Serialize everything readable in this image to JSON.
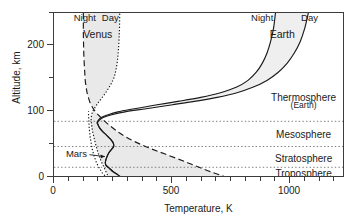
{
  "chart_data": {
    "type": "line",
    "title": "",
    "xlabel": "Temperature, K",
    "ylabel": "Altitude, km",
    "xlim": [
      0,
      1230
    ],
    "ylim": [
      0,
      262
    ],
    "xticks_major": [
      0,
      500,
      1000
    ],
    "xticks_major_labels": [
      "0",
      "500",
      "1000"
    ],
    "xticks_minor": [
      62.5,
      125,
      187.5,
      250,
      312.5,
      375,
      437.5,
      562.5,
      625,
      687.5,
      750,
      812.5,
      875,
      937.5,
      1062.5,
      1125,
      1187.5
    ],
    "yticks_major": [
      0,
      100,
      200
    ],
    "yticks_major_labels": [
      "0",
      "100",
      "200"
    ],
    "yticks_minor": [
      50,
      150,
      250
    ],
    "grid": "horizontal-dotted",
    "legend": "inline-annotations",
    "series": [
      {
        "name": "Venus Night",
        "style": "long-dash",
        "points": [
          [
            735,
            0
          ],
          [
            700,
            5
          ],
          [
            640,
            13
          ],
          [
            560,
            25
          ],
          [
            470,
            38
          ],
          [
            400,
            48
          ],
          [
            340,
            58
          ],
          [
            300,
            66
          ],
          [
            268,
            74
          ],
          [
            240,
            82
          ],
          [
            215,
            90
          ],
          [
            196,
            97
          ],
          [
            180,
            103
          ],
          [
            168,
            109
          ],
          [
            160,
            114
          ],
          [
            152,
            120
          ],
          [
            146,
            127
          ],
          [
            140,
            135
          ],
          [
            136,
            144
          ],
          [
            132,
            155
          ],
          [
            130,
            167
          ],
          [
            128,
            180
          ],
          [
            126,
            196
          ],
          [
            125,
            212
          ],
          [
            124,
            230
          ],
          [
            124,
            250
          ],
          [
            124,
            262
          ]
        ]
      },
      {
        "name": "Venus Day",
        "style": "dotted",
        "points": [
          [
            232,
            0
          ],
          [
            222,
            8
          ],
          [
            210,
            18
          ],
          [
            198,
            28
          ],
          [
            188,
            38
          ],
          [
            180,
            48
          ],
          [
            173,
            58
          ],
          [
            168,
            66
          ],
          [
            163,
            74
          ],
          [
            160,
            82
          ],
          [
            158,
            88
          ],
          [
            157,
            93
          ],
          [
            158,
            98
          ],
          [
            162,
            104
          ],
          [
            170,
            110
          ],
          [
            182,
            117
          ],
          [
            196,
            124
          ],
          [
            212,
            132
          ],
          [
            228,
            141
          ],
          [
            242,
            150
          ],
          [
            254,
            160
          ],
          [
            262,
            172
          ],
          [
            268,
            186
          ],
          [
            272,
            202
          ],
          [
            275,
            220
          ],
          [
            277,
            240
          ],
          [
            278,
            262
          ]
        ]
      },
      {
        "name": "Earth Night",
        "style": "solid",
        "points": [
          [
            288,
            0
          ],
          [
            270,
            5
          ],
          [
            250,
            10
          ],
          [
            232,
            16
          ],
          [
            220,
            20
          ],
          [
            217,
            25
          ],
          [
            222,
            32
          ],
          [
            232,
            40
          ],
          [
            244,
            46
          ],
          [
            252,
            50
          ],
          [
            250,
            56
          ],
          [
            238,
            62
          ],
          [
            222,
            68
          ],
          [
            205,
            74
          ],
          [
            192,
            80
          ],
          [
            185,
            85
          ],
          [
            182,
            88
          ],
          [
            188,
            92
          ],
          [
            200,
            96
          ],
          [
            225,
            100
          ],
          [
            270,
            105
          ],
          [
            340,
            110
          ],
          [
            430,
            116
          ],
          [
            530,
            122
          ],
          [
            620,
            128
          ],
          [
            700,
            135
          ],
          [
            770,
            144
          ],
          [
            820,
            155
          ],
          [
            855,
            168
          ],
          [
            880,
            182
          ],
          [
            900,
            198
          ],
          [
            915,
            216
          ],
          [
            928,
            238
          ],
          [
            936,
            262
          ]
        ]
      },
      {
        "name": "Earth Day",
        "style": "solid",
        "points": [
          [
            288,
            0
          ],
          [
            270,
            5
          ],
          [
            250,
            10
          ],
          [
            232,
            16
          ],
          [
            220,
            20
          ],
          [
            217,
            25
          ],
          [
            222,
            32
          ],
          [
            232,
            40
          ],
          [
            244,
            46
          ],
          [
            252,
            50
          ],
          [
            250,
            56
          ],
          [
            238,
            62
          ],
          [
            222,
            68
          ],
          [
            205,
            74
          ],
          [
            192,
            80
          ],
          [
            186,
            85
          ],
          [
            184,
            88
          ],
          [
            192,
            92
          ],
          [
            208,
            96
          ],
          [
            240,
            100
          ],
          [
            300,
            105
          ],
          [
            390,
            110
          ],
          [
            495,
            116
          ],
          [
            600,
            122
          ],
          [
            690,
            128
          ],
          [
            770,
            135
          ],
          [
            840,
            144
          ],
          [
            900,
            155
          ],
          [
            948,
            168
          ],
          [
            985,
            182
          ],
          [
            1015,
            198
          ],
          [
            1040,
            216
          ],
          [
            1060,
            238
          ],
          [
            1075,
            262
          ]
        ]
      },
      {
        "name": "Mars",
        "style": "dash-dot",
        "points": [
          [
            225,
            0
          ],
          [
            214,
            4
          ],
          [
            204,
            8
          ],
          [
            196,
            13
          ],
          [
            188,
            18
          ],
          [
            180,
            24
          ],
          [
            174,
            30
          ],
          [
            168,
            37
          ],
          [
            163,
            44
          ],
          [
            159,
            51
          ],
          [
            156,
            58
          ],
          [
            153,
            65
          ],
          [
            151,
            72
          ],
          [
            149,
            79
          ],
          [
            148,
            86
          ],
          [
            147,
            93
          ],
          [
            146,
            100
          ],
          [
            146,
            106
          ]
        ]
      }
    ],
    "shaded_bands": [
      {
        "name": "Venus day-night range",
        "between": [
          "Venus Night",
          "Venus Day"
        ],
        "fill": "#e9e9e9"
      },
      {
        "name": "Earth day-night range",
        "between": [
          "Earth Night",
          "Earth Day"
        ],
        "fill": "#efefef"
      }
    ],
    "layer_boundaries_km": [
      90,
      50,
      17
    ],
    "annotations": [
      {
        "text": "Night",
        "x": 130,
        "y": 256,
        "ref": "venus-night-label"
      },
      {
        "text": "Day",
        "x": 238,
        "y": 256,
        "ref": "venus-day-label"
      },
      {
        "text": "Venus",
        "x": 185,
        "y": 228,
        "ref": "venus-label"
      },
      {
        "text": "Night",
        "x": 880,
        "y": 256,
        "ref": "earth-night-label"
      },
      {
        "text": "Day",
        "x": 1080,
        "y": 256,
        "ref": "earth-day-label"
      },
      {
        "text": "Earth",
        "x": 965,
        "y": 228,
        "ref": "earth-label"
      },
      {
        "text": "Mars",
        "x": 95,
        "y": 40,
        "ref": "mars-label"
      },
      {
        "text": "Thermosphere",
        "x": 1055,
        "y": 128,
        "ref": "thermosphere-label"
      },
      {
        "text": "(Earth)",
        "x": 1055,
        "y": 116,
        "ref": "thermosphere-sublabel"
      },
      {
        "text": "Mesosphere",
        "x": 1055,
        "y": 70,
        "ref": "mesosphere-label"
      },
      {
        "text": "Stratosphere",
        "x": 1055,
        "y": 32,
        "ref": "stratosphere-label"
      },
      {
        "text": "Troposphere",
        "x": 1055,
        "y": 8,
        "ref": "troposphere-label"
      }
    ]
  },
  "axes": {
    "x_title": "Temperature, K",
    "y_title": "Altitude, km",
    "x_tick_labels": [
      "0",
      "500",
      "1000"
    ],
    "y_tick_labels": [
      "0",
      "100",
      "200"
    ]
  },
  "labels": {
    "venus": "Venus",
    "venus_night": "Night",
    "venus_day": "Day",
    "earth": "Earth",
    "earth_night": "Night",
    "earth_day": "Day",
    "mars": "Mars",
    "thermosphere": "Thermosphere",
    "thermosphere_sub": "(Earth)",
    "mesosphere": "Mesosphere",
    "stratosphere": "Stratosphere",
    "troposphere": "Troposphere"
  },
  "colors": {
    "axis": "#3c3c3c",
    "curve": "#1a1a1a",
    "gridline": "#808080",
    "venus_fill": "#e9e9e9",
    "earth_fill": "#efefef",
    "background": "#ffffff",
    "text": "#1a1a1a"
  }
}
